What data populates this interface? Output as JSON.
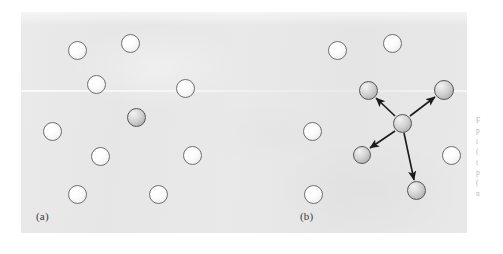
{
  "figure": {
    "background_color": "#ffffff",
    "plate_color": "#e8e8e8",
    "panels": [
      {
        "id": "a",
        "label": "(a)",
        "description": "Random arrangement of particles with one shaded central particle and no motion vectors"
      },
      {
        "id": "b",
        "label": "(b)",
        "description": "Central shaded particle with four arrows radiating outward toward four shaded particles"
      }
    ],
    "particle_colors": {
      "light_fill": "#fdfdfd",
      "light_stroke": "#6f6f6f",
      "shaded_fill": "#cfcfcf",
      "shaded_stroke": "#555555",
      "arrow_color": "#1b1b1b"
    },
    "panel_a_particles": [
      {
        "name": "particle-a1",
        "x": 77,
        "y": 50,
        "d": 19,
        "kind": "light"
      },
      {
        "name": "particle-a2",
        "x": 130,
        "y": 43,
        "d": 19,
        "kind": "light"
      },
      {
        "name": "particle-a3",
        "x": 96,
        "y": 84,
        "d": 19,
        "kind": "light"
      },
      {
        "name": "particle-a4",
        "x": 185,
        "y": 88,
        "d": 19,
        "kind": "light"
      },
      {
        "name": "particle-a5",
        "x": 52,
        "y": 131,
        "d": 19,
        "kind": "light"
      },
      {
        "name": "particle-a6",
        "x": 136,
        "y": 117,
        "d": 19,
        "kind": "shaded"
      },
      {
        "name": "particle-a7",
        "x": 100,
        "y": 156,
        "d": 19,
        "kind": "light"
      },
      {
        "name": "particle-a8",
        "x": 192,
        "y": 155,
        "d": 19,
        "kind": "light"
      },
      {
        "name": "particle-a9",
        "x": 77,
        "y": 194,
        "d": 19,
        "kind": "light"
      },
      {
        "name": "particle-a10",
        "x": 158,
        "y": 194,
        "d": 19,
        "kind": "light"
      }
    ],
    "panel_b_particles": [
      {
        "name": "particle-b1",
        "x": 337,
        "y": 50,
        "d": 19,
        "kind": "light"
      },
      {
        "name": "particle-b2",
        "x": 392,
        "y": 43,
        "d": 19,
        "kind": "light"
      },
      {
        "name": "particle-b3",
        "x": 312,
        "y": 131,
        "d": 19,
        "kind": "light"
      },
      {
        "name": "particle-b4",
        "x": 313,
        "y": 194,
        "d": 19,
        "kind": "light"
      },
      {
        "name": "particle-b5",
        "x": 451,
        "y": 155,
        "d": 19,
        "kind": "light"
      },
      {
        "name": "particle-b-center",
        "x": 402,
        "y": 123,
        "d": 19,
        "kind": "shaded"
      },
      {
        "name": "particle-b-upper-left",
        "x": 368,
        "y": 90,
        "d": 19,
        "kind": "shaded"
      },
      {
        "name": "particle-b-upper-right",
        "x": 444,
        "y": 90,
        "d": 20,
        "kind": "shaded"
      },
      {
        "name": "particle-b-lower-left",
        "x": 362,
        "y": 155,
        "d": 18,
        "kind": "shaded"
      },
      {
        "name": "particle-b-bottom",
        "x": 416,
        "y": 190,
        "d": 19,
        "kind": "shaded"
      }
    ],
    "panel_b_arrows": [
      {
        "name": "arrow-upper-left",
        "x1": 395,
        "y1": 116,
        "x2": 376,
        "y2": 98
      },
      {
        "name": "arrow-upper-right",
        "x1": 410,
        "y1": 116,
        "x2": 435,
        "y2": 97
      },
      {
        "name": "arrow-lower-left",
        "x1": 395,
        "y1": 131,
        "x2": 370,
        "y2": 148
      },
      {
        "name": "arrow-bottom",
        "x1": 404,
        "y1": 133,
        "x2": 414,
        "y2": 180
      }
    ]
  },
  "margin_caption": {
    "note": "caption text clipped at right image edge - illegible",
    "lines": [
      "F",
      "p",
      "t",
      "(",
      "t",
      "p",
      "(",
      "n"
    ]
  }
}
